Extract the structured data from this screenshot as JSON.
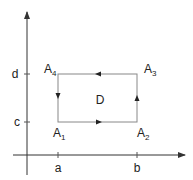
{
  "diagram": {
    "colors": {
      "axis": "#333333",
      "rect": "#777777",
      "arrow": "#222222",
      "text": "#222222"
    },
    "axes": {
      "x_ticks": [
        {
          "label": "a",
          "x": 58
        },
        {
          "label": "b",
          "x": 137
        }
      ],
      "y_ticks": [
        {
          "label": "c",
          "y": 122
        },
        {
          "label": "d",
          "y": 74
        }
      ]
    },
    "region_label": "D",
    "vertices": [
      {
        "name": "A",
        "sub": "1",
        "corner": "bottom-left"
      },
      {
        "name": "A",
        "sub": "2",
        "corner": "bottom-right"
      },
      {
        "name": "A",
        "sub": "3",
        "corner": "top-right"
      },
      {
        "name": "A",
        "sub": "4",
        "corner": "top-left"
      }
    ],
    "orientation": "counterclockwise"
  }
}
